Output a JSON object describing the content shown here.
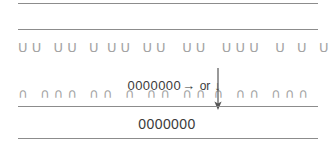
{
  "diagram": {
    "rules": [
      {
        "name": "rule-top",
        "color": "#8c8c8c"
      },
      {
        "name": "rule-upper",
        "color": "#8c8c8c"
      },
      {
        "name": "rule-lower",
        "color": "#8c8c8c"
      },
      {
        "name": "rule-bottom",
        "color": "#8c8c8c"
      }
    ],
    "upper_glyph_row": {
      "glyph": "U",
      "text": "U U   U U   U  U U   U U    U U    U U U    U   U   U",
      "color": "#a3a3a3"
    },
    "lower_glyph_row": {
      "glyph": "∩",
      "text": "∩   ∩ ∩ ∩   ∩ ∩   ∩   ∩ ∩   ∩ ∩  ∩   ∩ ∩   ∩ ∩ ∩",
      "color": "#a3a3a3"
    },
    "caption": {
      "code": "0000000",
      "arrow_right": "→",
      "or_label": "or",
      "arrow_down": "↓",
      "color": "#3b3b3b"
    },
    "bottom_caption": {
      "code": "0000000",
      "color": "#3b3b3b"
    },
    "long_arrow": {
      "direction": "down",
      "color": "#555555"
    }
  }
}
